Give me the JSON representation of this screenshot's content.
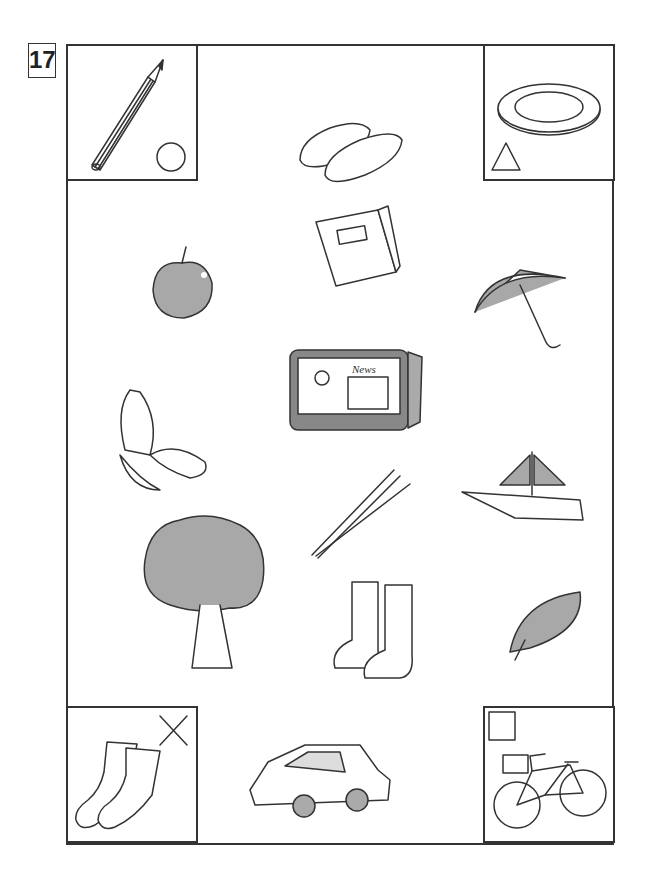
{
  "page": {
    "number": "17"
  },
  "corners": [
    {
      "item": "pencil",
      "mark": "circle"
    },
    {
      "item": "plate",
      "mark": "triangle"
    },
    {
      "item": "socks",
      "mark": "cross"
    },
    {
      "item": "bicycle",
      "mark": "square"
    }
  ],
  "items": [
    "slippers",
    "book",
    "apple",
    "umbrella",
    "television",
    "butterfly",
    "chopsticks",
    "sailboat",
    "tree",
    "boots",
    "leaf",
    "car"
  ],
  "tv": {
    "headline": "News",
    "caption": "神奈太郎"
  },
  "colors": {
    "line": "#333333",
    "gray_fill": "#a8a8a8"
  }
}
